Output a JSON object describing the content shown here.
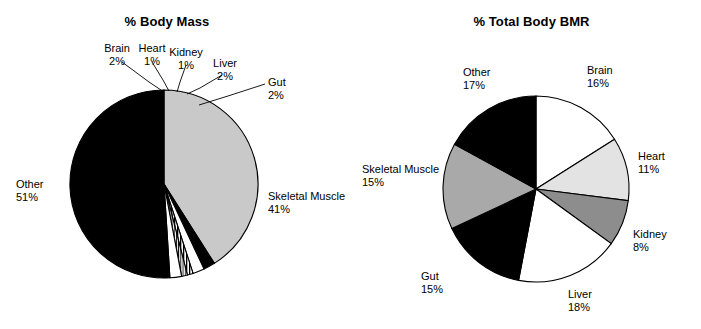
{
  "figure": {
    "width": 701,
    "height": 329,
    "background": "#ffffff"
  },
  "chart_data": [
    {
      "type": "pie",
      "id": "body-mass",
      "title": "% Body Mass",
      "unit": "%",
      "total": 100,
      "legend_position": "outside-labels",
      "center": {
        "x": 164,
        "y": 184
      },
      "radius": 94,
      "start_angle_deg": -90,
      "direction": "clockwise",
      "categories": [
        "Skeletal Muscle",
        "Gut",
        "Liver",
        "Kidney",
        "Heart",
        "Brain",
        "Other"
      ],
      "values": [
        41,
        2,
        2,
        1,
        1,
        2,
        51
      ],
      "slices": [
        {
          "name": "Skeletal Muscle",
          "value": 41,
          "label": "Skeletal Muscle",
          "pct_label": "41%",
          "fill": "#c9c9c9",
          "pattern": "solid",
          "label_x": 268,
          "label_y": 190,
          "align": "left",
          "leader": false
        },
        {
          "name": "Gut",
          "value": 2,
          "label": "Gut",
          "pct_label": "2%",
          "fill": "#000000",
          "pattern": "solid",
          "label_x": 268,
          "label_y": 76,
          "align": "left",
          "leader": true,
          "leader_points": "265,84 228,96 199,105"
        },
        {
          "name": "Liver",
          "value": 2,
          "label": "Liver",
          "pct_label": "2%",
          "fill": "#ffffff",
          "pattern": "solid",
          "label_x": 225,
          "label_y": 57,
          "align": "center",
          "leader": true,
          "leader_points": "222,75 200,88 187,94"
        },
        {
          "name": "Kidney",
          "value": 1,
          "label": "Kidney",
          "pct_label": "1%",
          "fill": "#000000",
          "pattern": "stripes",
          "label_x": 186,
          "label_y": 46,
          "align": "center",
          "leader": true,
          "leader_points": "186,65 180,82 177,92"
        },
        {
          "name": "Heart",
          "value": 1,
          "label": "Heart",
          "pct_label": "1%",
          "fill": "#000000",
          "pattern": "thin-lines",
          "label_x": 152,
          "label_y": 42,
          "align": "center",
          "leader": true,
          "leader_points": "152,62 163,80 169,91"
        },
        {
          "name": "Brain",
          "value": 2,
          "label": "Brain",
          "pct_label": "2%",
          "fill": "#ffffff",
          "pattern": "solid",
          "label_x": 117,
          "label_y": 42,
          "align": "center",
          "leader": true,
          "leader_points": "122,62 149,82 161,90"
        },
        {
          "name": "Other",
          "value": 51,
          "label": "Other",
          "pct_label": "51%",
          "fill": "#000000",
          "pattern": "solid",
          "label_x": 16,
          "label_y": 178,
          "align": "left",
          "leader": false
        }
      ]
    },
    {
      "type": "pie",
      "id": "total-body-bmr",
      "title": "% Total Body BMR",
      "unit": "%",
      "total": 100,
      "legend_position": "outside-labels",
      "center": {
        "x": 536,
        "y": 189
      },
      "radius": 93,
      "start_angle_deg": -90,
      "direction": "clockwise",
      "categories": [
        "Brain",
        "Heart",
        "Kidney",
        "Liver",
        "Gut",
        "Skeletal Muscle",
        "Other"
      ],
      "values": [
        16,
        11,
        8,
        18,
        15,
        15,
        17
      ],
      "slices": [
        {
          "name": "Brain",
          "value": 16,
          "label": "Brain",
          "pct_label": "16%",
          "fill": "#ffffff",
          "pattern": "solid",
          "label_x": 587,
          "label_y": 64,
          "align": "left",
          "leader": false
        },
        {
          "name": "Heart",
          "value": 11,
          "label": "Heart",
          "pct_label": "11%",
          "fill": "#e3e3e3",
          "pattern": "solid",
          "label_x": 638,
          "label_y": 150,
          "align": "left",
          "leader": false
        },
        {
          "name": "Kidney",
          "value": 8,
          "label": "Kidney",
          "pct_label": "8%",
          "fill": "#8d8d8d",
          "pattern": "solid",
          "label_x": 633,
          "label_y": 228,
          "align": "left",
          "leader": false
        },
        {
          "name": "Liver",
          "value": 18,
          "label": "Liver",
          "pct_label": "18%",
          "fill": "#ffffff",
          "pattern": "solid",
          "label_x": 568,
          "label_y": 288,
          "align": "left",
          "leader": false
        },
        {
          "name": "Gut",
          "value": 15,
          "label": "Gut",
          "pct_label": "15%",
          "fill": "#000000",
          "pattern": "solid",
          "label_x": 421,
          "label_y": 270,
          "align": "left",
          "leader": false
        },
        {
          "name": "Skeletal Muscle",
          "value": 15,
          "label": "Skeletal Muscle",
          "pct_label": "15%",
          "fill": "#a9a9a9",
          "pattern": "solid",
          "label_x": 362,
          "label_y": 163,
          "align": "left",
          "leader": false
        },
        {
          "name": "Other",
          "value": 17,
          "label": "Other",
          "pct_label": "17%",
          "fill": "#000000",
          "pattern": "solid",
          "label_x": 463,
          "label_y": 66,
          "align": "left",
          "leader": false
        }
      ]
    }
  ]
}
